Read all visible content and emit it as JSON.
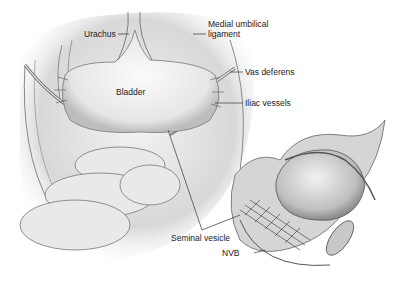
{
  "figure": {
    "labels": {
      "urachus": "Urachus",
      "medial_umbilical_1": "Medial umbilical",
      "medial_umbilical_2": "ligament",
      "vas_deferens": "Vas deferens",
      "bladder": "Bladder",
      "iliac_vessels": "Iliac vessels",
      "seminal_vesicle": "Seminal vesicle",
      "nvb": "NVB"
    }
  }
}
